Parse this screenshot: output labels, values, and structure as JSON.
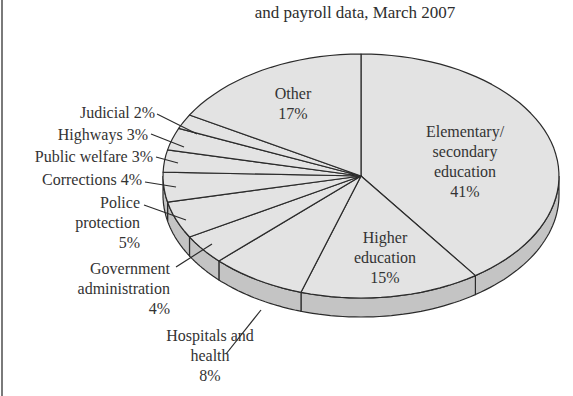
{
  "title_line": "and payroll data, March 2007",
  "colors": {
    "slice_fill": "#e3e3e3",
    "side_fill": "#c4c4c4",
    "outline": "#2b2b2b",
    "text": "#333333"
  },
  "labels": {
    "elementary": [
      "Elementary/",
      "secondary",
      "education",
      "41%"
    ],
    "higher_ed": [
      "Higher",
      "education",
      "15%"
    ],
    "hospitals": [
      "Hospitals and",
      "health",
      "8%"
    ],
    "gov_admin": [
      "Government",
      "administration",
      "4%"
    ],
    "police": [
      "Police",
      "protection",
      "5%"
    ],
    "corrections": "Corrections 4%",
    "public_welfare": "Public welfare 3%",
    "highways": "Highways 3%",
    "judicial": "Judicial 2%",
    "other": [
      "Other",
      "17%"
    ]
  },
  "chart_data": {
    "type": "pie",
    "title": "and payroll data, March 2007",
    "style": "3d-elliptical",
    "start_angle": "12 o'clock, clockwise",
    "categories": [
      "Elementary/secondary education",
      "Higher education",
      "Hospitals and health",
      "Government administration",
      "Police protection",
      "Corrections",
      "Public welfare",
      "Highways",
      "Judicial",
      "Other"
    ],
    "values": [
      41,
      15,
      8,
      4,
      5,
      4,
      3,
      3,
      2,
      17
    ],
    "unit": "%"
  }
}
